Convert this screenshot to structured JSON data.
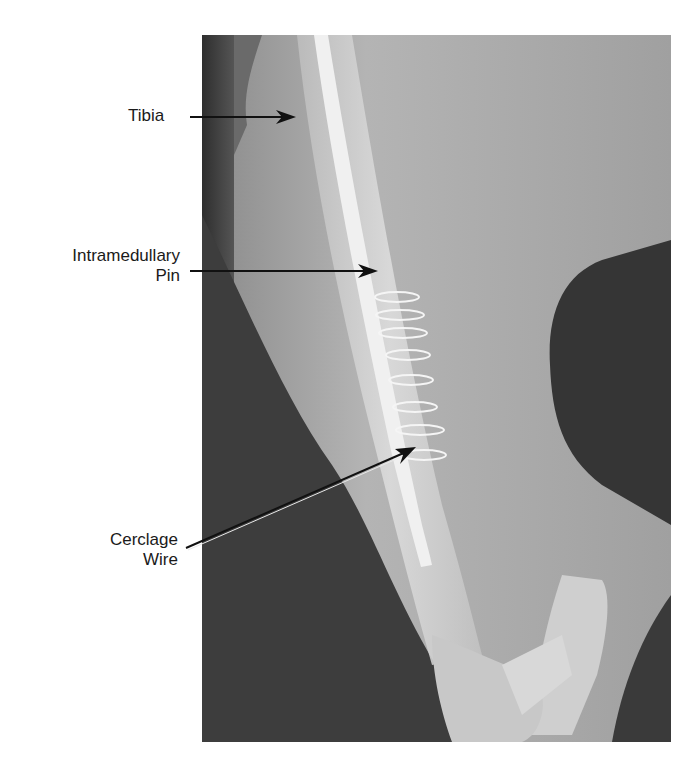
{
  "figure": {
    "type": "radiograph",
    "colors": {
      "background": "#ffffff",
      "label_text": "#1a1a1a",
      "arrow": "#111111",
      "soft_tissue": "#a8a8a8",
      "dark_background": "#3a3a3a",
      "bone": "#d6d6d6",
      "pin": "#f2f2f2"
    }
  },
  "labels": [
    {
      "id": "tibia",
      "text": "Tibia"
    },
    {
      "id": "pin_line1",
      "text": "Intramedullary"
    },
    {
      "id": "pin_line2",
      "text": "Pin"
    },
    {
      "id": "wire_line1",
      "text": "Cerclage"
    },
    {
      "id": "wire_line2",
      "text": "Wire"
    }
  ]
}
